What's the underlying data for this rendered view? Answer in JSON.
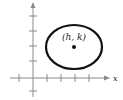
{
  "diagram": {
    "type": "ellipse-on-coordinate-plane",
    "center_label": "(h, k)",
    "x_axis_label": "x",
    "colors": {
      "axis": "#8a8a8a",
      "ellipse": "#111111",
      "point": "#111111",
      "text": "#222222"
    },
    "origin_px": [
      33,
      78
    ],
    "x_ticks_px": [
      19,
      47,
      61,
      75,
      89
    ],
    "y_ticks_px": [
      16,
      31,
      46,
      61,
      91
    ],
    "ellipse": {
      "cx": 74,
      "cy": 47,
      "rx": 28,
      "ry": 22
    }
  }
}
